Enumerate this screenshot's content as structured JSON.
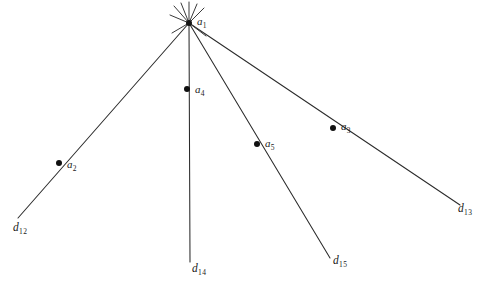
{
  "figure": {
    "width": 479,
    "height": 286,
    "background_color": "#ffffff",
    "line_color": "#2b2b2b",
    "label_color": "#1a1a1a"
  },
  "apex": {
    "name": "a1",
    "label_base": "a",
    "label_sub": "1",
    "x": 189,
    "y": 23,
    "label_x": 197,
    "label_y": 16
  },
  "nodes": [
    {
      "name": "a2",
      "label_base": "a",
      "label_sub": "2",
      "x": 59,
      "y": 163,
      "label_x": 67,
      "label_y": 159,
      "on_ray": "d12"
    },
    {
      "name": "a4",
      "label_base": "a",
      "label_sub": "4",
      "x": 187,
      "y": 89,
      "label_x": 195,
      "label_y": 84,
      "on_ray": "d14"
    },
    {
      "name": "a5",
      "label_base": "a",
      "label_sub": "5",
      "x": 257,
      "y": 144,
      "label_x": 265,
      "label_y": 138,
      "on_ray": "d15"
    },
    {
      "name": "a3",
      "label_base": "a",
      "label_sub": "3",
      "x": 333,
      "y": 128,
      "label_x": 341,
      "label_y": 121,
      "on_ray": "d13"
    }
  ],
  "rays": [
    {
      "name": "d12",
      "label_base": "d",
      "label_sub": "12",
      "x1": 189,
      "y1": 23,
      "x2": 18,
      "y2": 218,
      "label_x": 13,
      "label_y": 222
    },
    {
      "name": "d14",
      "label_base": "d",
      "label_sub": "14",
      "x1": 189,
      "y1": 23,
      "x2": 190,
      "y2": 262,
      "label_x": 192,
      "label_y": 263
    },
    {
      "name": "d15",
      "label_base": "d",
      "label_sub": "15",
      "x1": 189,
      "y1": 23,
      "x2": 330,
      "y2": 258,
      "label_x": 333,
      "label_y": 255
    },
    {
      "name": "d13",
      "label_base": "d",
      "label_sub": "13",
      "x1": 189,
      "y1": 23,
      "x2": 460,
      "y2": 205,
      "label_x": 458,
      "label_y": 203
    }
  ],
  "apex_stubs": [
    {
      "name": "stub-1",
      "x1": 189,
      "y1": 23,
      "x2": 174,
      "y2": 6
    },
    {
      "name": "stub-2",
      "x1": 189,
      "y1": 23,
      "x2": 181,
      "y2": 3
    },
    {
      "name": "stub-3",
      "x1": 189,
      "y1": 23,
      "x2": 189,
      "y2": 2
    },
    {
      "name": "stub-4",
      "x1": 189,
      "y1": 23,
      "x2": 197,
      "y2": 4
    },
    {
      "name": "stub-5",
      "x1": 189,
      "y1": 23,
      "x2": 204,
      "y2": 8
    },
    {
      "name": "stub-6",
      "x1": 189,
      "y1": 23,
      "x2": 170,
      "y2": 15
    },
    {
      "name": "stub-7",
      "x1": 189,
      "y1": 23,
      "x2": 172,
      "y2": 33
    },
    {
      "name": "stub-8",
      "x1": 189,
      "y1": 23,
      "x2": 206,
      "y2": 36
    }
  ]
}
